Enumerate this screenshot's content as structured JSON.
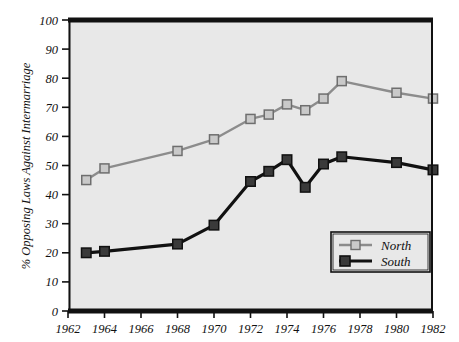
{
  "chart_data": {
    "type": "line",
    "title": "",
    "xlabel": "",
    "ylabel": "% Opposing Laws Against Intermarriage",
    "xlim": [
      1962,
      1982
    ],
    "ylim": [
      0,
      100
    ],
    "grid": false,
    "legend_position": "bottom-right",
    "xticks": [
      1962,
      1964,
      1966,
      1968,
      1970,
      1972,
      1974,
      1976,
      1978,
      1980,
      1982
    ],
    "xticklabels": [
      "1962",
      "1964",
      "1966",
      "1968",
      "1970",
      "1972",
      "1974",
      "1976",
      "1978",
      "1980",
      "1982"
    ],
    "yticks": [
      0,
      10,
      20,
      30,
      40,
      50,
      60,
      70,
      80,
      90,
      100
    ],
    "yticklabels": [
      "0",
      "10",
      "20",
      "30",
      "40",
      "50",
      "60",
      "70",
      "80",
      "90",
      "100"
    ],
    "series": [
      {
        "name": "North",
        "color": "#8c8c8c",
        "marker": "square",
        "marker_face": "#c9c9c9",
        "marker_edge": "#6e6e6e",
        "x": [
          1963,
          1964,
          1968,
          1970,
          1972,
          1973,
          1974,
          1975,
          1976,
          1977,
          1980,
          1982
        ],
        "values": [
          45,
          49,
          55,
          59,
          66,
          67.5,
          71,
          69,
          73,
          79,
          75,
          73
        ]
      },
      {
        "name": "South",
        "color": "#111111",
        "marker": "square",
        "marker_face": "#3a3a3a",
        "marker_edge": "#111111",
        "x": [
          1963,
          1964,
          1968,
          1970,
          1972,
          1973,
          1974,
          1975,
          1976,
          1977,
          1980,
          1982
        ],
        "values": [
          20,
          20.5,
          23,
          29.5,
          44.5,
          48,
          52,
          42.5,
          50.5,
          53,
          51,
          48.5
        ]
      }
    ]
  },
  "legend": {
    "entries": [
      {
        "label": "North"
      },
      {
        "label": "South"
      }
    ]
  },
  "axes": {
    "y_title": "% Opposing Laws Against Intermarriage"
  }
}
